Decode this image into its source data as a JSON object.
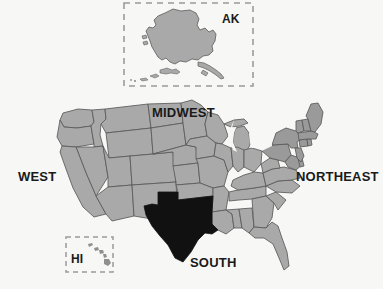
{
  "map": {
    "title": "United States Census Regions Map",
    "background_color": "#f7f7f5",
    "state_fill": "#a9a9a9",
    "state_fill_northeast": "#9a9a9a",
    "state_border_color": "#5a5a5a",
    "highlight_fill": "#111111",
    "highlighted_state": "Texas",
    "inset_border_color": "#9b9b9b",
    "label_color": "#1a1a1a",
    "regions": [
      {
        "id": "west",
        "label": "WEST"
      },
      {
        "id": "midwest",
        "label": "MIDWEST"
      },
      {
        "id": "northeast",
        "label": "NORTHEAST"
      },
      {
        "id": "south",
        "label": "SOUTH"
      }
    ],
    "insets": [
      {
        "id": "alaska",
        "label": "AK"
      },
      {
        "id": "hawaii",
        "label": "HI"
      }
    ]
  }
}
